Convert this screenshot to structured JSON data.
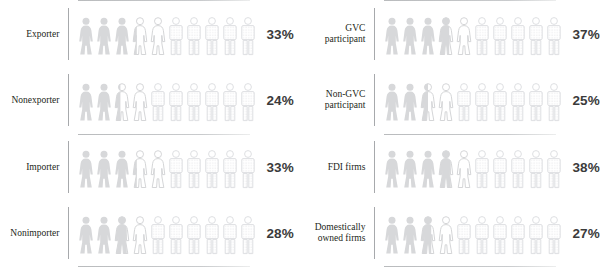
{
  "chart_data": {
    "type": "pictogram",
    "title": "",
    "xlabel": "",
    "ylabel": "",
    "unit": "percent",
    "icons_per_row": 10,
    "icon_value": 10,
    "colors": {
      "filled_figure": "#d7d8da",
      "outline_figure": "#e2e3e5",
      "dotted_figure": "#e6e7e9",
      "axis_line": "#a7a9ac",
      "rule_line": "#c3c5c7",
      "label_text": "#231f20",
      "value_text": "#3b3b3b",
      "background": "#ffffff"
    },
    "panels": [
      {
        "id": "trade-status",
        "blocks": [
          {
            "id": "exporter-block",
            "rows": [
              {
                "label": "Exporter",
                "value": 33,
                "value_label": "33%"
              },
              {
                "label": "Nonexporter",
                "value": 24,
                "value_label": "24%"
              }
            ]
          },
          {
            "id": "importer-block",
            "rows": [
              {
                "label": "Importer",
                "value": 33,
                "value_label": "33%"
              },
              {
                "label": "Nonimporter",
                "value": 28,
                "value_label": "28%"
              }
            ]
          }
        ]
      },
      {
        "id": "gvc-ownership",
        "blocks": [
          {
            "id": "gvc-block",
            "rows": [
              {
                "label": "GVC participant",
                "value": 37,
                "value_label": "37%"
              },
              {
                "label": "Non-GVC\nparticipant",
                "value": 25,
                "value_label": "25%"
              }
            ]
          },
          {
            "id": "ownership-block",
            "rows": [
              {
                "label": "FDI firms",
                "value": 38,
                "value_label": "38%"
              },
              {
                "label": "Domestically\nowned firms",
                "value": 27,
                "value_label": "27%"
              }
            ]
          }
        ]
      }
    ]
  }
}
